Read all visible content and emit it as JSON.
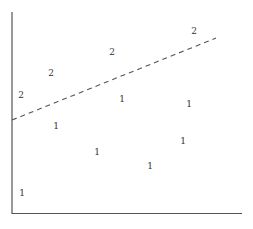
{
  "chart_data": {
    "type": "scatter",
    "title": "",
    "xlabel": "",
    "ylabel": "",
    "grid": false,
    "legend": null,
    "marker_style": "text labels (class number)",
    "axis_ranges": {
      "x": [
        0,
        230
      ],
      "y": [
        0,
        200
      ]
    },
    "series": [
      {
        "name": "1",
        "label": "1",
        "points": [
          {
            "x": 44,
            "y": 87
          },
          {
            "x": 110,
            "y": 114
          },
          {
            "x": 177,
            "y": 109
          },
          {
            "x": 85,
            "y": 61
          },
          {
            "x": 171,
            "y": 72
          },
          {
            "x": 138,
            "y": 47
          },
          {
            "x": 10,
            "y": 20
          }
        ]
      },
      {
        "name": "2",
        "label": "2",
        "points": [
          {
            "x": 9,
            "y": 118
          },
          {
            "x": 39,
            "y": 140
          },
          {
            "x": 100,
            "y": 161
          },
          {
            "x": 182,
            "y": 182
          }
        ]
      }
    ],
    "annotations": [
      {
        "type": "dashed_line",
        "description": "separating boundary line",
        "from": {
          "x": 0,
          "y": 93
        },
        "to": {
          "x": 204,
          "y": 175
        }
      }
    ]
  },
  "colors": {
    "axis": "#555555",
    "text": "#333333",
    "line": "#555555",
    "background": "#ffffff"
  },
  "layout": {
    "plot_left_px": 12,
    "plot_bottom_px": 213,
    "px_per_unit_x": 1,
    "px_per_unit_y": 1
  }
}
